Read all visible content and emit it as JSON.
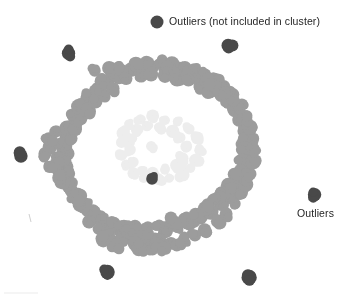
{
  "figure": {
    "width": 356,
    "height": 300,
    "background": "#ffffff"
  },
  "annotations": {
    "legend_label": "Outliers (not included in cluster)",
    "outliers_label": "Outliers"
  },
  "colors": {
    "cluster_point": "#9c9c9c",
    "cluster_point_light": "#ededed",
    "outlier_point": "#494949",
    "text": "#262626",
    "faint_mark": "#cfcfcf"
  },
  "chart_data": {
    "type": "scatter",
    "title": "",
    "xlabel": "",
    "ylabel": "",
    "grid": false,
    "axes_visible": false,
    "legend_position": "top-center",
    "xlim": [
      0,
      356
    ],
    "ylim": [
      0,
      300
    ],
    "note": "Pixel coordinates; y increases downward as drawn.",
    "series": [
      {
        "name": "Cluster (ring-shaped dense region)",
        "color": "#9c9c9c",
        "marker": "circle",
        "marker_radius": 6.5,
        "shape": "annulus",
        "center": [
          155,
          157
        ],
        "outer_radius_x": 112,
        "outer_radius_y": 95,
        "inner_radius_x": 60,
        "inner_radius_y": 48,
        "point_count": 186,
        "points": [
          [
            154,
            66
          ],
          [
            143,
            68
          ],
          [
            166,
            67
          ],
          [
            131,
            72
          ],
          [
            178,
            69
          ],
          [
            119,
            77
          ],
          [
            190,
            72
          ],
          [
            108,
            83
          ],
          [
            201,
            76
          ],
          [
            98,
            90
          ],
          [
            212,
            81
          ],
          [
            89,
            98
          ],
          [
            222,
            88
          ],
          [
            81,
            107
          ],
          [
            231,
            96
          ],
          [
            74,
            117
          ],
          [
            238,
            106
          ],
          [
            69,
            128
          ],
          [
            244,
            117
          ],
          [
            65,
            139
          ],
          [
            248,
            129
          ],
          [
            63,
            151
          ],
          [
            250,
            141
          ],
          [
            63,
            163
          ],
          [
            250,
            153
          ],
          [
            65,
            175
          ],
          [
            248,
            165
          ],
          [
            69,
            186
          ],
          [
            244,
            176
          ],
          [
            74,
            196
          ],
          [
            238,
            187
          ],
          [
            81,
            205
          ],
          [
            231,
            196
          ],
          [
            89,
            213
          ],
          [
            222,
            204
          ],
          [
            98,
            220
          ],
          [
            212,
            212
          ],
          [
            108,
            226
          ],
          [
            201,
            218
          ],
          [
            119,
            231
          ],
          [
            190,
            223
          ],
          [
            131,
            235
          ],
          [
            178,
            228
          ],
          [
            143,
            238
          ],
          [
            166,
            231
          ],
          [
            154,
            240
          ],
          [
            157,
            240
          ],
          [
            147,
            63
          ],
          [
            162,
            62
          ],
          [
            136,
            64
          ],
          [
            172,
            64
          ],
          [
            124,
            70
          ],
          [
            184,
            67
          ],
          [
            113,
            75
          ],
          [
            195,
            70
          ],
          [
            103,
            81
          ],
          [
            206,
            74
          ],
          [
            94,
            89
          ],
          [
            216,
            80
          ],
          [
            86,
            97
          ],
          [
            226,
            87
          ],
          [
            79,
            106
          ],
          [
            234,
            95
          ],
          [
            73,
            116
          ],
          [
            241,
            105
          ],
          [
            68,
            127
          ],
          [
            246,
            116
          ],
          [
            66,
            138
          ],
          [
            249,
            128
          ],
          [
            65,
            150
          ],
          [
            251,
            140
          ],
          [
            66,
            162
          ],
          [
            250,
            152
          ],
          [
            68,
            173
          ],
          [
            247,
            164
          ],
          [
            72,
            184
          ],
          [
            243,
            175
          ],
          [
            78,
            194
          ],
          [
            237,
            186
          ],
          [
            85,
            203
          ],
          [
            229,
            195
          ],
          [
            93,
            211
          ],
          [
            220,
            203
          ],
          [
            102,
            218
          ],
          [
            210,
            211
          ],
          [
            112,
            224
          ],
          [
            199,
            217
          ],
          [
            123,
            229
          ],
          [
            188,
            222
          ],
          [
            134,
            233
          ],
          [
            176,
            226
          ],
          [
            146,
            236
          ],
          [
            164,
            229
          ],
          [
            96,
            72
          ],
          [
            110,
            69
          ],
          [
            118,
            66
          ],
          [
            126,
            79
          ],
          [
            140,
            76
          ],
          [
            152,
            74
          ],
          [
            164,
            75
          ],
          [
            176,
            78
          ],
          [
            188,
            81
          ],
          [
            200,
            85
          ],
          [
            210,
            90
          ],
          [
            220,
            96
          ],
          [
            228,
            103
          ],
          [
            235,
            111
          ],
          [
            240,
            120
          ],
          [
            243,
            130
          ],
          [
            244,
            140
          ],
          [
            244,
            150
          ],
          [
            242,
            160
          ],
          [
            239,
            169
          ],
          [
            235,
            178
          ],
          [
            229,
            186
          ],
          [
            222,
            194
          ],
          [
            214,
            201
          ],
          [
            205,
            207
          ],
          [
            195,
            213
          ],
          [
            184,
            218
          ],
          [
            172,
            222
          ],
          [
            160,
            225
          ],
          [
            148,
            227
          ],
          [
            136,
            228
          ],
          [
            124,
            227
          ],
          [
            113,
            224
          ],
          [
            102,
            220
          ],
          [
            92,
            214
          ],
          [
            84,
            207
          ],
          [
            77,
            199
          ],
          [
            72,
            190
          ],
          [
            68,
            180
          ],
          [
            66,
            170
          ],
          [
            66,
            160
          ],
          [
            67,
            149
          ],
          [
            70,
            139
          ],
          [
            74,
            129
          ],
          [
            80,
            120
          ],
          [
            87,
            111
          ],
          [
            95,
            103
          ],
          [
            104,
            96
          ],
          [
            114,
            90
          ],
          [
            59,
            144
          ],
          [
            57,
            157
          ],
          [
            58,
            170
          ],
          [
            62,
            183
          ],
          [
            54,
            133
          ],
          [
            52,
            148
          ],
          [
            55,
            163
          ],
          [
            60,
            177
          ],
          [
            48,
            140
          ],
          [
            46,
            155
          ],
          [
            50,
            168
          ],
          [
            88,
            222
          ],
          [
            98,
            230
          ],
          [
            110,
            236
          ],
          [
            122,
            240
          ],
          [
            134,
            243
          ],
          [
            146,
            245
          ],
          [
            158,
            245
          ],
          [
            170,
            243
          ],
          [
            182,
            240
          ],
          [
            194,
            235
          ],
          [
            206,
            229
          ],
          [
            217,
            221
          ],
          [
            227,
            213
          ],
          [
            235,
            204
          ],
          [
            241,
            194
          ],
          [
            246,
            184
          ],
          [
            250,
            173
          ],
          [
            253,
            162
          ],
          [
            254,
            150
          ],
          [
            253,
            138
          ],
          [
            250,
            127
          ],
          [
            246,
            117
          ],
          [
            240,
            108
          ],
          [
            233,
            100
          ],
          [
            225,
            93
          ],
          [
            216,
            87
          ],
          [
            206,
            82
          ],
          [
            196,
            78
          ],
          [
            186,
            75
          ],
          [
            175,
            72
          ],
          [
            140,
            248
          ],
          [
            152,
            250
          ],
          [
            164,
            248
          ],
          [
            176,
            245
          ],
          [
            116,
            245
          ],
          [
            104,
            241
          ]
        ]
      },
      {
        "name": "Cluster interior faint residue",
        "color": "#ededed",
        "marker": "circle",
        "marker_radius": 5.5,
        "point_count": 34,
        "points": [
          [
            130,
            123
          ],
          [
            142,
            119
          ],
          [
            154,
            117
          ],
          [
            166,
            119
          ],
          [
            178,
            123
          ],
          [
            188,
            130
          ],
          [
            124,
            132
          ],
          [
            196,
            139
          ],
          [
            120,
            143
          ],
          [
            199,
            150
          ],
          [
            121,
            155
          ],
          [
            197,
            160
          ],
          [
            126,
            166
          ],
          [
            191,
            169
          ],
          [
            134,
            173
          ],
          [
            182,
            176
          ],
          [
            145,
            178
          ],
          [
            170,
            179
          ],
          [
            157,
            179
          ],
          [
            136,
            130
          ],
          [
            148,
            126
          ],
          [
            160,
            127
          ],
          [
            172,
            131
          ],
          [
            181,
            138
          ],
          [
            131,
            140
          ],
          [
            185,
            147
          ],
          [
            130,
            150
          ],
          [
            183,
            158
          ],
          [
            134,
            163
          ],
          [
            176,
            166
          ],
          [
            143,
            170
          ],
          [
            165,
            171
          ],
          [
            154,
            172
          ],
          [
            150,
            145
          ]
        ]
      },
      {
        "name": "Outliers (not included in cluster)",
        "color": "#494949",
        "marker": "circle",
        "marker_radius": 6.5,
        "point_count": 7,
        "points": [
          [
            69,
            52
          ],
          [
            228,
            45
          ],
          [
            20,
            155
          ],
          [
            152,
            178
          ],
          [
            314,
            194
          ],
          [
            108,
            273
          ],
          [
            250,
            278
          ]
        ]
      }
    ],
    "legend_marker": {
      "x": 157,
      "y": 22,
      "radius": 6.5,
      "color": "#494949"
    },
    "stray_marks": [
      {
        "type": "tick",
        "x": 29,
        "y": 218,
        "color": "#cfcfcf"
      },
      {
        "type": "hline",
        "x": 4,
        "y": 293,
        "width": 34,
        "color": "#ebebeb"
      }
    ]
  }
}
